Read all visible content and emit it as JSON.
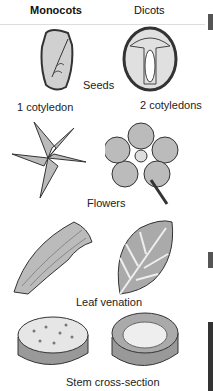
{
  "headers": {
    "left": "Monocots",
    "right": "Dicots"
  },
  "rows": [
    {
      "label": "Seeds",
      "left_caption": "1 cotyledon",
      "right_caption": "2 cotyledons"
    },
    {
      "label": "Flowers"
    },
    {
      "label": "Leaf venation"
    },
    {
      "label": "Stem cross-section"
    }
  ],
  "colors": {
    "illustration_fill": "#c8c8c8",
    "illustration_stroke": "#333333",
    "text": "#111111"
  }
}
